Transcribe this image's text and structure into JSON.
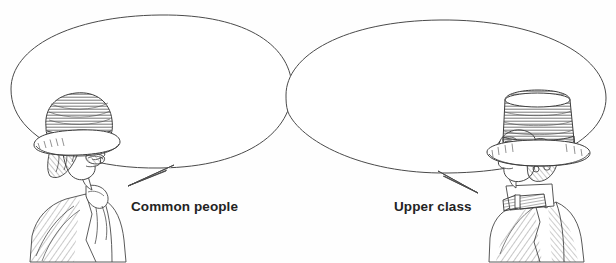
{
  "figure": {
    "kind": "scanned-line-drawing",
    "background_color": "#fefefe",
    "ink_color": "#3a3a3a",
    "label_color": "#232323",
    "width": 616,
    "height": 263,
    "captions": {
      "left_label": "Common people",
      "right_label": "Upper class"
    },
    "speech_bubbles": [
      {
        "id": "left-bubble",
        "owner": "common-people-man",
        "text": "",
        "shape": "ellipse",
        "tail_direction": "down-left"
      },
      {
        "id": "right-bubble",
        "owner": "upper-class-man",
        "text": "",
        "shape": "ellipse",
        "tail_direction": "down-right"
      }
    ],
    "characters": [
      {
        "id": "common-people-man",
        "label": "Common people",
        "headwear": "bowler-hat",
        "facial_hair": "moustache and sideburns",
        "facing": "right",
        "attire": "work jacket with neckerchief"
      },
      {
        "id": "upper-class-man",
        "label": "Upper class",
        "headwear": "top-hat",
        "facial_hair": "clean shaven with curled sideburns",
        "facing": "left",
        "attire": "high collar with bow tie and coat"
      }
    ],
    "scan_artifacts": {
      "top_clipped_text": "",
      "bottom_clipped_text": ""
    }
  }
}
